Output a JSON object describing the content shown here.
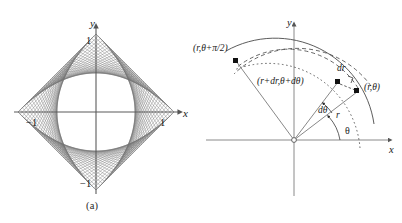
{
  "figure": {
    "panels": [
      {
        "id": "a",
        "caption": "(a)",
        "axis": {
          "x_label": "x",
          "y_label": "y",
          "x_tick_neg": "−1",
          "x_tick_pos": "1",
          "y_tick_pos": "1",
          "y_tick_neg": "−1"
        },
        "description": "pinwheel string-art envelope, four curved lobes inscribed in a square with vertices at (1,0),(0,1),(-1,0),(0,-1)"
      },
      {
        "id": "b",
        "caption": "(b)",
        "axis": {
          "x_label": "x",
          "y_label": "y"
        },
        "labels": {
          "point_r_theta": "(r,θ)",
          "point_r_theta_plus_half_pi": "(r,θ+π/2)",
          "point_r_plus_dr": "(r+dr,θ+dθ)",
          "dr": "dr",
          "dtheta": "dθ",
          "r": "r",
          "theta": "θ"
        }
      }
    ]
  },
  "chart_data": {
    "type": "line",
    "title": "",
    "panel_a": {
      "type": "line",
      "title": "",
      "xlabel": "x",
      "ylabel": "y",
      "xlim": [
        -1.25,
        1.25
      ],
      "ylim": [
        -1.25,
        1.25
      ],
      "xticks": [
        -1,
        1
      ],
      "xticklabels": [
        "−1",
        "1"
      ],
      "yticks": [
        -1,
        1
      ],
      "yticklabels": [
        "−1",
        "1"
      ],
      "grid": false,
      "legend": null,
      "families": 4,
      "lines_per_family": 36,
      "envelope": "four-lobed pinwheel",
      "square_vertices": [
        [
          1,
          0
        ],
        [
          0,
          1
        ],
        [
          -1,
          0
        ],
        [
          0,
          -1
        ]
      ]
    },
    "panel_b": {
      "type": "scatter",
      "title": "",
      "xlabel": "x",
      "ylabel": "y",
      "grid": false,
      "legend": null,
      "points": [
        {
          "label": "(r,θ)",
          "r": 1.0,
          "theta_deg": 32
        },
        {
          "label": "(r+dr,θ+dθ)",
          "r": 0.9,
          "theta_deg": 48
        },
        {
          "label": "(r,θ+π/2)",
          "r": 1.0,
          "theta_deg": 122
        }
      ],
      "arcs": [
        {
          "style": "solid",
          "r": 1.12,
          "from_deg": 8,
          "to_deg": 132
        },
        {
          "style": "dashed",
          "r": 1.0,
          "from_deg": 30,
          "to_deg": 128
        },
        {
          "style": "dashed",
          "r": 0.9,
          "from_deg": 40,
          "to_deg": 132
        },
        {
          "style": "dotted",
          "r": 1.0,
          "from_deg": -4,
          "to_deg": 128
        }
      ],
      "angles": [
        {
          "label": "θ",
          "value_deg": 32
        },
        {
          "label": "dθ",
          "value_deg": 16
        }
      ],
      "segments": [
        {
          "label": "r",
          "from": "origin",
          "to": "(r,θ)"
        },
        {
          "label": "dr",
          "from": "(r+dr,θ+dθ)",
          "to": "(r,θ) radial projection"
        }
      ]
    }
  }
}
